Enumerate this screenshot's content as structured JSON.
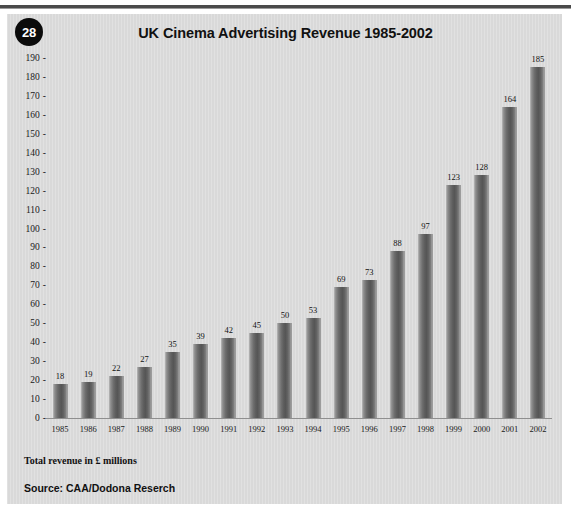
{
  "page": {
    "badge_number": "28",
    "note": "Total revenue in £ millions",
    "source": "Source: CAA/Dodona Reserch"
  },
  "colors": {
    "panel_background": "#d9d9d9",
    "bar_fill": "#6e6e6e",
    "badge_background": "#0b0b0b",
    "badge_text": "#ffffff",
    "text": "#111111",
    "top_rule": "#4a4a4a"
  },
  "chart_data": {
    "type": "bar",
    "title": "UK Cinema Advertising Revenue 1985-2002",
    "subtitle": "",
    "xlabel": "",
    "ylabel": "",
    "ylim": [
      0,
      190
    ],
    "ytick_step": 10,
    "yticks": [
      0,
      10,
      20,
      30,
      40,
      50,
      60,
      70,
      80,
      90,
      100,
      110,
      120,
      130,
      140,
      150,
      160,
      170,
      180,
      190
    ],
    "grid": false,
    "legend": false,
    "data_labels": true,
    "units": "£ millions",
    "categories": [
      "1985",
      "1986",
      "1987",
      "1988",
      "1989",
      "1990",
      "1991",
      "1992",
      "1993",
      "1994",
      "1995",
      "1996",
      "1997",
      "1998",
      "1999",
      "2000",
      "2001",
      "2002"
    ],
    "values": [
      18,
      19,
      22,
      27,
      35,
      39,
      42,
      45,
      50,
      53,
      69,
      73,
      88,
      97,
      123,
      128,
      164,
      185
    ]
  }
}
